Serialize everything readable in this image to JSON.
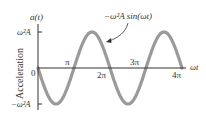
{
  "chart_data": {
    "type": "line",
    "title": "",
    "ylabel": "Acceleration",
    "y_axis_symbol": "a(t)",
    "xlabel": "ωt",
    "x_ticks": [
      "0",
      "π",
      "2π",
      "3π",
      "4π"
    ],
    "x_tick_values": [
      0,
      3.1416,
      6.2832,
      9.4248,
      12.5664
    ],
    "y_ticks": [
      "ω²A",
      "−ω²A"
    ],
    "y_tick_values": [
      1,
      -1
    ],
    "ylim": [
      -1,
      1
    ],
    "xlim": [
      0,
      12.5664
    ],
    "grid": false,
    "legend": false,
    "series": [
      {
        "name": "−ω²A sin(ωt)",
        "function": "-sin(x)",
        "x": [
          0,
          1.5708,
          3.1416,
          4.7124,
          6.2832,
          7.854,
          9.4248,
          10.9956,
          12.5664
        ],
        "values": [
          0,
          -1,
          0,
          1,
          0,
          -1,
          0,
          1,
          0
        ],
        "color": "#9a9a9a"
      }
    ],
    "annotations": [
      {
        "text": "−ω²A sin(ωt)",
        "arrow_to": "descending segment near ωt ≈ 3π/2"
      }
    ]
  },
  "labels": {
    "y_symbol": "a(t)",
    "y_title": "Acceleration",
    "y_top": "ω²A",
    "y_bottom": "−ω²A",
    "x_symbol": "ωt",
    "origin": "0",
    "pi": "π",
    "two_pi": "2π",
    "three_pi": "3π",
    "four_pi": "4π",
    "curve_annotation": "−ω²A sin(ωt)"
  },
  "colors": {
    "curve": "#9a9a9a",
    "axis": "#333333",
    "text": "#333333"
  }
}
